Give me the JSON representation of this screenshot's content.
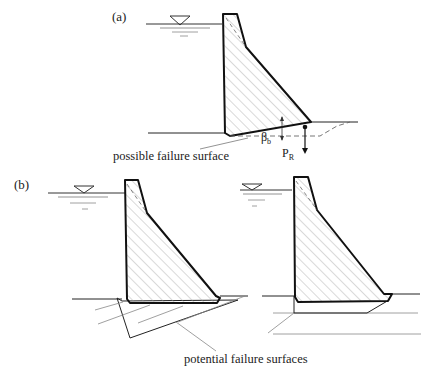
{
  "panels": {
    "a": {
      "label": "(a)",
      "annotation": "possible failure surface",
      "symbols": {
        "angle": "β",
        "angle_sub": "b",
        "force": "P",
        "force_sub": "R"
      }
    },
    "b": {
      "label": "(b)",
      "annotation": "potential failure surfaces"
    }
  },
  "colors": {
    "outline": "#111111",
    "hatch": "#9a9a9a",
    "thin": "#555555"
  }
}
